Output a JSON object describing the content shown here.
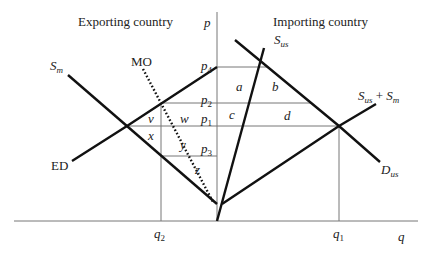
{
  "titles": {
    "left": "Exporting country",
    "right": "Importing country"
  },
  "axes": {
    "y_label": "p",
    "x_label": "q"
  },
  "price_levels": [
    {
      "name": "p4",
      "base": "p",
      "sub": "4"
    },
    {
      "name": "p2",
      "base": "p",
      "sub": "2"
    },
    {
      "name": "p1",
      "base": "p",
      "sub": "1"
    },
    {
      "name": "p3",
      "base": "p",
      "sub": "3"
    }
  ],
  "quantity_levels": [
    {
      "name": "q2",
      "base": "q",
      "sub": "2"
    },
    {
      "name": "q1",
      "base": "q",
      "sub": "1"
    }
  ],
  "curves": {
    "sm": {
      "base": "S",
      "sub": "m"
    },
    "mo": "MO",
    "ed": "ED",
    "sus": {
      "base": "S",
      "sub": "us"
    },
    "sus_sm": {
      "base1": "S",
      "sub1": "us",
      "plus": " + ",
      "base2": "S",
      "sub2": "m"
    },
    "dus": {
      "base": "D",
      "sub": "us"
    }
  },
  "areas": {
    "a": "a",
    "b": "b",
    "c": "c",
    "d": "d",
    "v": "v",
    "w": "w",
    "x": "x",
    "y": "y",
    "z": "z"
  },
  "colors": {
    "curve": "#111111",
    "guide": "#777777"
  }
}
